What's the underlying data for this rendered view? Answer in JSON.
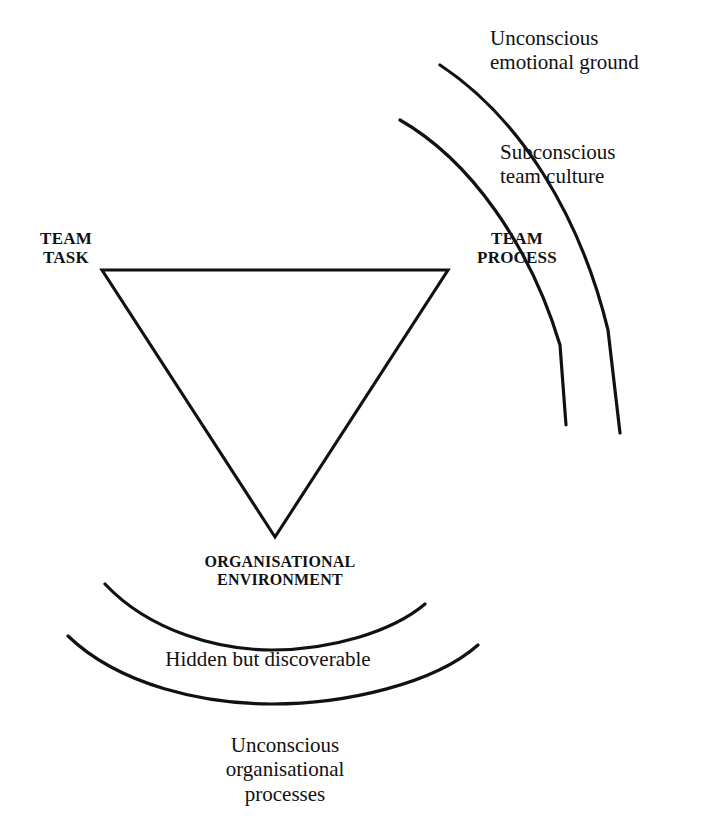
{
  "diagram": {
    "background_color": "#ffffff",
    "line_color": "#111111",
    "triangle": {
      "name": "inverted-triangle",
      "vertices": {
        "top_left": {
          "x": 102,
          "y": 270
        },
        "top_right": {
          "x": 448,
          "y": 270
        },
        "bottom": {
          "x": 275,
          "y": 537
        }
      }
    },
    "vertex_labels": {
      "team_task": "TEAM\nTASK",
      "team_process": "TEAM\nPROCESS",
      "organisational_environment": "ORGANISATIONAL\nENVIRONMENT"
    },
    "ring_labels": {
      "unconscious_emotional_ground": "Unconscious\nemotional ground",
      "subconscious_team_culture": "Subconscious\nteam culture",
      "hidden_but_discoverable": "Hidden but discoverable",
      "unconscious_organisational_processes": "Unconscious\norganisational\nprocesses"
    },
    "arcs": {
      "upper_right_inner": {
        "name": "subconscious-team-culture-arc",
        "path": "M 400 120 C 470 160, 530 245, 560 345 L 566 425"
      },
      "upper_right_outer": {
        "name": "unconscious-emotional-ground-arc",
        "path": "M 440 65 C 520 118, 580 215, 608 330 L 620 433"
      },
      "lower_inner": {
        "name": "hidden-but-discoverable-arc",
        "path": "M 105 584 C 150 632, 220 650, 272 650 C 330 650, 392 632, 425 604"
      },
      "lower_outer": {
        "name": "unconscious-organisational-processes-arc",
        "path": "M 68 636 C 120 686, 205 704, 272 704 C 345 704, 434 684, 478 645"
      }
    }
  }
}
